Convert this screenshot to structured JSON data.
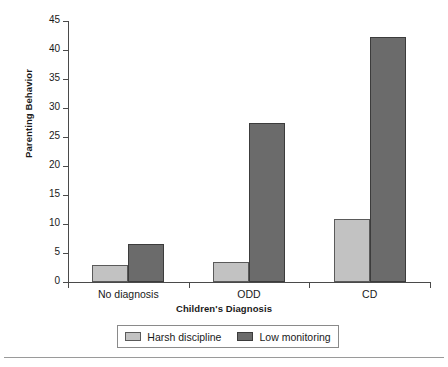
{
  "chart_data": {
    "type": "bar",
    "title": "",
    "xlabel": "Children's Diagnosis",
    "ylabel": "Parenting Behavior",
    "categories": [
      "No diagnosis",
      "ODD",
      "CD"
    ],
    "series": [
      {
        "name": "Harsh discipline",
        "values": [
          3.0,
          3.4,
          10.8
        ],
        "color": "#c2c2c2"
      },
      {
        "name": "Low monitoring",
        "values": [
          6.5,
          27.4,
          42.3
        ],
        "color": "#6b6b6b"
      }
    ],
    "ylim": [
      0,
      45
    ],
    "yticks": [
      0,
      5,
      10,
      15,
      20,
      25,
      30,
      35,
      40,
      45
    ],
    "ytick_labels": [
      "0",
      "5",
      "10",
      "15",
      "20",
      "25",
      "30",
      "35",
      "40",
      "45"
    ],
    "grid": false,
    "legend_position": "bottom"
  },
  "legend": {
    "entries": [
      {
        "label": "Harsh discipline"
      },
      {
        "label": "Low monitoring"
      }
    ]
  },
  "axis": {
    "y_title": "Parenting Behavior",
    "x_title": "Children's Diagnosis"
  }
}
